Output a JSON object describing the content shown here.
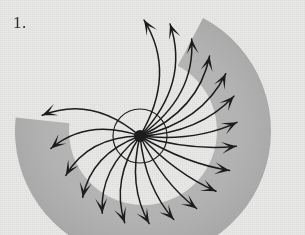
{
  "figure": {
    "label": "1.",
    "caption_text": "",
    "type": "radial-vector-field-diagram",
    "background_color": "#e9e9e7",
    "ink_color": "#1c1c1c",
    "band_color": "#a9a9a9",
    "band_color_light": "#bcbcbc"
  },
  "chart_data": {
    "type": "scatter",
    "title": "",
    "subtitle": "",
    "xlabel": "",
    "ylabel": "",
    "grid": false,
    "legend": null,
    "annotations": [
      "1."
    ],
    "origin": {
      "x": 140,
      "y": 136
    },
    "hub_radius": 6,
    "inner_circle_radius": 27,
    "xlim": [
      0,
      305
    ],
    "ylim": [
      0,
      235
    ],
    "band": {
      "description": "gray crescent band sweeping clockwise from upper-right around bottom to mid-left",
      "center_x": 143,
      "center_y": 131,
      "outer_radius": 128,
      "inner_radius": 74,
      "start_angle_deg": -62,
      "end_angle_deg": 186,
      "fill": "#a9a9a9"
    },
    "series": [
      {
        "name": "radial-arrows",
        "count": 19,
        "values": [
          {
            "index": 0,
            "angle_deg": -88,
            "length": 116,
            "curl": 0.3,
            "tip_x": 144,
            "tip_y": 20
          },
          {
            "index": 1,
            "angle_deg": -75,
            "length": 116,
            "curl": 0.3,
            "tip_x": 170,
            "tip_y": 24
          },
          {
            "index": 2,
            "angle_deg": -62,
            "length": 110,
            "curl": 0.28,
            "tip_x": 195,
            "tip_y": 33
          },
          {
            "index": 3,
            "angle_deg": -49,
            "length": 106,
            "curl": 0.26,
            "tip_x": 216,
            "tip_y": 49
          },
          {
            "index": 4,
            "angle_deg": -36,
            "length": 106,
            "curl": 0.24,
            "tip_x": 234,
            "tip_y": 70
          },
          {
            "index": 5,
            "angle_deg": -23,
            "length": 102,
            "curl": 0.2,
            "tip_x": 249,
            "tip_y": 96
          },
          {
            "index": 6,
            "angle_deg": -8,
            "length": 98,
            "curl": 0.14,
            "tip_x": 259,
            "tip_y": 124
          },
          {
            "index": 7,
            "angle_deg": 6,
            "length": 97,
            "curl": 0.1,
            "tip_x": 257,
            "tip_y": 150
          },
          {
            "index": 8,
            "angle_deg": 21,
            "length": 96,
            "curl": 0.1,
            "tip_x": 243,
            "tip_y": 172
          },
          {
            "index": 9,
            "angle_deg": 36,
            "length": 94,
            "curl": 0.1,
            "tip_x": 221,
            "tip_y": 190
          },
          {
            "index": 10,
            "angle_deg": 52,
            "length": 92,
            "curl": 0.12,
            "tip_x": 194,
            "tip_y": 203
          },
          {
            "index": 11,
            "angle_deg": 68,
            "length": 90,
            "curl": 0.16,
            "tip_x": 163,
            "tip_y": 210
          },
          {
            "index": 12,
            "angle_deg": 84,
            "length": 88,
            "curl": 0.2,
            "tip_x": 133,
            "tip_y": 209
          },
          {
            "index": 13,
            "angle_deg": 100,
            "length": 88,
            "curl": 0.24,
            "tip_x": 106,
            "tip_y": 199
          },
          {
            "index": 14,
            "angle_deg": 116,
            "length": 86,
            "curl": 0.26,
            "tip_x": 82,
            "tip_y": 182
          },
          {
            "index": 15,
            "angle_deg": 133,
            "length": 84,
            "curl": 0.28,
            "tip_x": 62,
            "tip_y": 160
          },
          {
            "index": 16,
            "angle_deg": 152,
            "length": 84,
            "curl": 0.28,
            "tip_x": 50,
            "tip_y": 136
          },
          {
            "index": 17,
            "angle_deg": 172,
            "length": 90,
            "curl": 0.28,
            "tip_x": 43,
            "tip_y": 110
          },
          {
            "index": 18,
            "angle_deg": -168,
            "length": 100,
            "curl": 0.3,
            "tip_x": 62,
            "tip_y": 62
          }
        ]
      }
    ]
  }
}
